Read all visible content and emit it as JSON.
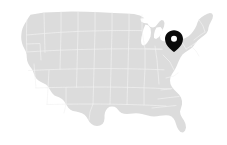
{
  "widget": {
    "type": "map",
    "title": "United States location map",
    "width": 227,
    "height": 145,
    "background_color": "#ffffff"
  },
  "map": {
    "region_label": "Contiguous United States",
    "land_fill_color": "#dcdcdc",
    "border_stroke_color": "#f2f2f2",
    "water_fill_color": "#ffffff",
    "show_state_borders": true,
    "projection_hint": "albers-usa"
  },
  "markers": [
    {
      "name": "location-pin",
      "label": "",
      "icon": "map-pin-icon",
      "color": "#0a0a0a",
      "inner_color": "#ffffff",
      "x": 174,
      "y": 52,
      "approx_region": "Michigan / Great Lakes"
    }
  ],
  "chart_data": {
    "type": "map",
    "title": "United States location map",
    "legend": [],
    "annotations": [
      {
        "type": "pin",
        "x": 174,
        "y": 52,
        "region": "Michigan / Great Lakes",
        "color": "#0a0a0a"
      }
    ]
  }
}
